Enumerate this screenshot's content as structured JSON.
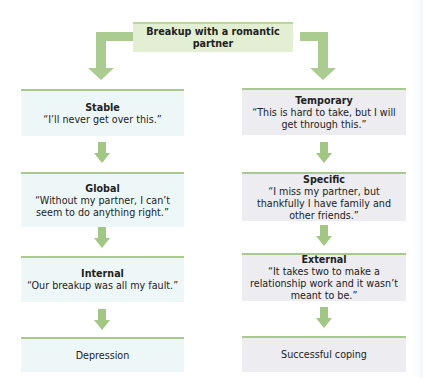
{
  "root": {
    "label": "Breakup with a romantic partner"
  },
  "colors": {
    "arrow": "#a2c784",
    "left_box_bg": "#eef7f8",
    "right_box_bg": "#ececf1",
    "top_box_bg": "#e2efd3",
    "box_top_border": "#a9c98e"
  },
  "left_branch": {
    "nodes": [
      {
        "title": "Stable",
        "quote": "“I’ll never get over this.”"
      },
      {
        "title": "Global",
        "quote": "“Without my partner, I can’t seem to do anything right.”"
      },
      {
        "title": "Internal",
        "quote": "“Our breakup was all my fault.”"
      }
    ],
    "outcome": "Depression"
  },
  "right_branch": {
    "nodes": [
      {
        "title": "Temporary",
        "quote": "“This is hard to take, but I will get through this.”"
      },
      {
        "title": "Specific",
        "quote": "“I miss my partner, but thankfully I have family and other friends.”"
      },
      {
        "title": "External",
        "quote": "“It takes two to make a relationship work and it wasn’t meant to be.”"
      }
    ],
    "outcome": "Successful coping"
  }
}
